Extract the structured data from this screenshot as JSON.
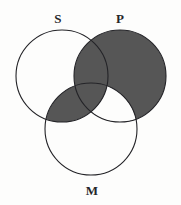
{
  "figure": {
    "kind": "venn-diagram",
    "width": 181,
    "height": 205,
    "background_color": "#fdfdfc"
  },
  "style": {
    "shade_color": "#565656",
    "stroke_color": "#232327",
    "stroke_width": 1.1,
    "unshaded_color": "#ffffff",
    "label_color": "#25262a"
  },
  "circles": [
    {
      "id": "S",
      "label": "S",
      "cx": 62,
      "cy": 76,
      "r": 46,
      "label_x": 58,
      "label_y": 18
    },
    {
      "id": "P",
      "label": "P",
      "cx": 120,
      "cy": 76,
      "r": 46,
      "label_x": 120,
      "label_y": 18
    },
    {
      "id": "M",
      "label": "M",
      "cx": 91,
      "cy": 129,
      "r": 46,
      "label_x": 92,
      "label_y": 190
    }
  ],
  "regions": [
    {
      "id": "S-only",
      "expression": "S only",
      "shaded": false
    },
    {
      "id": "P-only",
      "expression": "P only",
      "shaded": true
    },
    {
      "id": "M-only",
      "expression": "M only",
      "shaded": false
    },
    {
      "id": "S-and-P",
      "expression": "S and P, not M",
      "shaded": true
    },
    {
      "id": "S-and-M",
      "expression": "S and M, not P",
      "shaded": true
    },
    {
      "id": "P-and-M",
      "expression": "P and M, not S",
      "shaded": false
    },
    {
      "id": "S-P-M",
      "expression": "S and P and M",
      "shaded": true
    }
  ]
}
